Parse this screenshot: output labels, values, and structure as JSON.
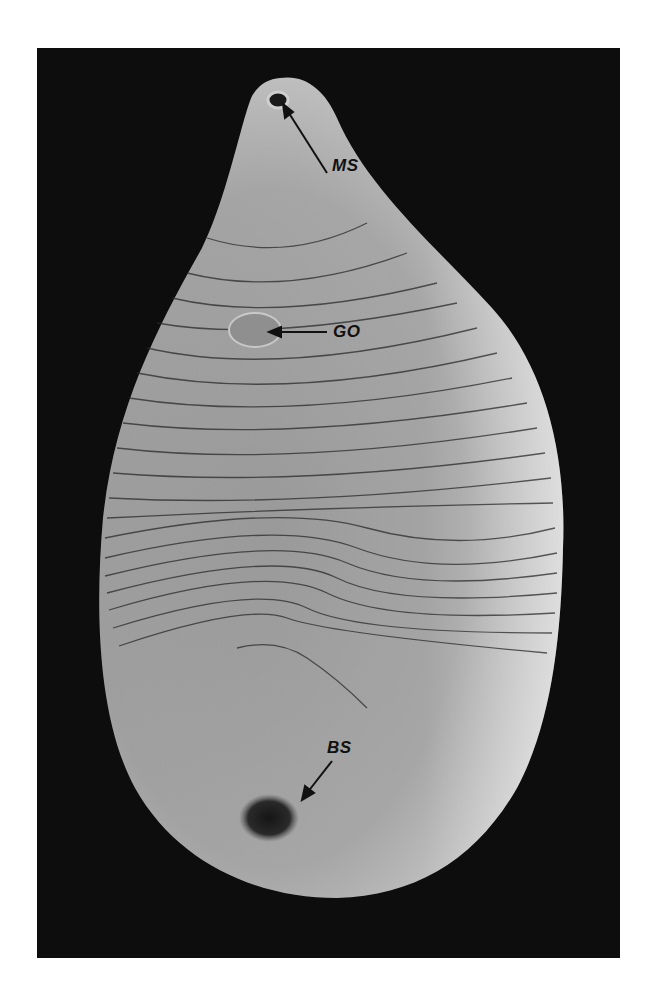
{
  "figure": {
    "type": "scanning electron micrograph",
    "background_color": "#0d0d0d",
    "specimen_color": "#a8a8a8",
    "labels": [
      {
        "id": "MS",
        "text": "MS",
        "points_to": "oral sucker at anterior tip"
      },
      {
        "id": "GO",
        "text": "GO",
        "points_to": "genital opening"
      },
      {
        "id": "BS",
        "text": "BS",
        "points_to": "ventral sucker / posterior opening"
      }
    ]
  }
}
